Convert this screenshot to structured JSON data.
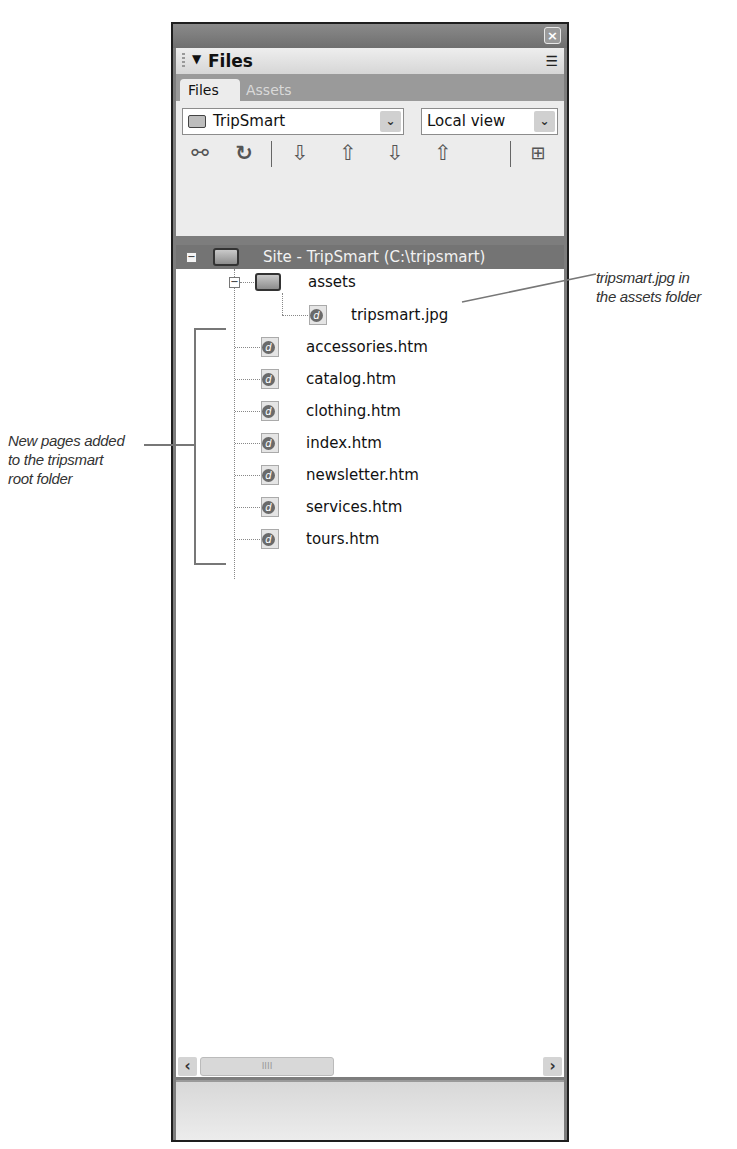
{
  "panel": {
    "close_label": "×",
    "header": {
      "collapse_glyph": "▼",
      "title": "Files",
      "options_glyph": "☰"
    },
    "tabs": [
      {
        "label": "Files",
        "active": true
      },
      {
        "label": "Assets",
        "active": false
      }
    ],
    "site_select": {
      "value": "TripSmart",
      "arrow": "⌄"
    },
    "view_select": {
      "value": "Local view",
      "arrow": "⌄"
    },
    "toolbar": [
      {
        "name": "connect",
        "glyph": "⚯"
      },
      {
        "name": "refresh",
        "glyph": "↻"
      },
      {
        "name": "get",
        "glyph": "⇩"
      },
      {
        "name": "put",
        "glyph": "⇧"
      },
      {
        "name": "check-out",
        "glyph": "⇩"
      },
      {
        "name": "check-in",
        "glyph": "⇧"
      },
      {
        "name": "expand",
        "glyph": "⊞"
      }
    ],
    "tree": {
      "site_row": {
        "expander": "−",
        "label": "Site - TripSmart (C:\\tripsmart)"
      },
      "assets_folder": {
        "expander": "−",
        "label": "assets"
      },
      "asset_files": [
        {
          "label": "tripsmart.jpg"
        }
      ],
      "root_files": [
        {
          "label": "accessories.htm"
        },
        {
          "label": "catalog.htm"
        },
        {
          "label": "clothing.htm"
        },
        {
          "label": "index.htm"
        },
        {
          "label": "newsletter.htm"
        },
        {
          "label": "services.htm"
        },
        {
          "label": "tours.htm"
        }
      ]
    },
    "scrollbar": {
      "left": "‹",
      "right": "›",
      "thumb_grip": "IIII"
    }
  },
  "annotations": {
    "asset_callout": [
      "tripsmart.jpg in",
      "the assets folder"
    ],
    "pages_callout": [
      "New pages added",
      "to the tripsmart",
      "root folder"
    ]
  }
}
